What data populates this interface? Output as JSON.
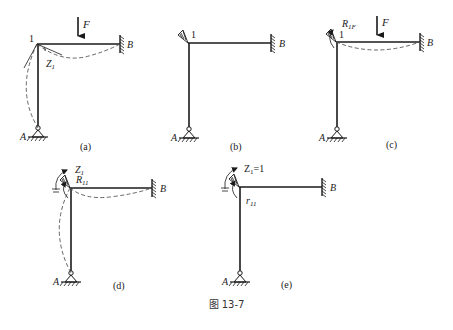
{
  "figure": {
    "caption": "图 13-7",
    "panels": [
      {
        "id": "a",
        "label": "(a)",
        "joint_label": "1",
        "fixed_end_label": "B",
        "pin_label": "A",
        "load_label": "F",
        "rotation_label": "Z",
        "rotation_subscript": "1",
        "description": "Original frame under load F; joint 1 rotates by Z1, deflected shape dashed"
      },
      {
        "id": "b",
        "label": "(b)",
        "joint_label": "1",
        "fixed_end_label": "B",
        "pin_label": "A",
        "description": "Basic system with added rotational restraint at joint 1"
      },
      {
        "id": "c",
        "label": "(c)",
        "joint_label": "1",
        "fixed_end_label": "B",
        "pin_label": "A",
        "load_label": "F",
        "reaction_label": "R",
        "reaction_subscript": "1F",
        "description": "Basic system under load F; restraint reaction R1F"
      },
      {
        "id": "d",
        "label": "(d)",
        "fixed_end_label": "B",
        "pin_label": "A",
        "rotation_label": "Z",
        "rotation_subscript": "1",
        "reaction_label": "R",
        "reaction_subscript": "11",
        "description": "Basic system with imposed rotation Z1; reaction R11"
      },
      {
        "id": "e",
        "label": "(e)",
        "fixed_end_label": "B",
        "pin_label": "A",
        "rotation_label": "Z",
        "rotation_subscript": "1",
        "rotation_value": "=1",
        "coef_label": "r",
        "coef_subscript": "11",
        "description": "Unit rotation Z1=1; stiffness coefficient r11"
      }
    ]
  },
  "colors": {
    "ink": "#1a1a1a",
    "deflection": "#555555",
    "background": "#ffffff"
  }
}
